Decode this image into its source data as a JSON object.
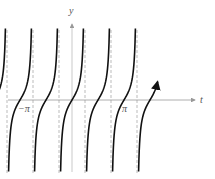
{
  "chart_data": {
    "type": "line",
    "title": "",
    "function": "y = tan(t)",
    "xlabel": "t",
    "ylabel": "y",
    "tick_labels": [
      {
        "text": "−π",
        "value": -3.14159
      },
      {
        "text": "π",
        "value": 3.14159
      }
    ],
    "asymptotes_dashed": true,
    "asymptote_positions": [
      "-5π/2",
      "-3π/2",
      "-π/2",
      "π/2",
      "3π/2",
      "5π/2"
    ],
    "branches": 7,
    "branch_centers": [
      "-3π",
      "-2π",
      "-π",
      "0",
      "π",
      "2π",
      "3π"
    ],
    "xlim": [
      -10.1,
      10.6
    ],
    "ylim": [
      -5.2,
      5.2
    ],
    "grid": false,
    "legend": null,
    "arrows": {
      "left_end": true,
      "right_end": true
    },
    "colors": {
      "curve": "#111111",
      "axes": "#999999",
      "asymptote": "#aaaaaa",
      "label": "#555555"
    }
  },
  "labels": {
    "x_axis": "t",
    "y_axis": "y",
    "neg_pi": "−π",
    "pos_pi": "π"
  }
}
